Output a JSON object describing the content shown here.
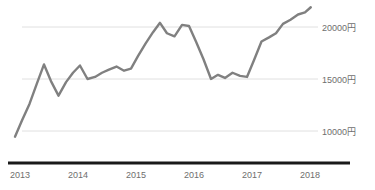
{
  "chart_data": {
    "type": "line",
    "title": "",
    "xlabel": "",
    "ylabel": "",
    "unit_suffix": "円",
    "grid": true,
    "legend": "none",
    "line_color": "#808080",
    "axis_color": "#1a1a1a",
    "gridline_color": "#e0e0e0",
    "tick_label_color": "#6e6e6e",
    "xlim": [
      2013,
      2019
    ],
    "ylim": [
      7000,
      22600
    ],
    "x_ticks": [
      "2013",
      "2014",
      "2015",
      "2016",
      "2017",
      "2018"
    ],
    "x_tick_values": [
      2013,
      2014,
      2015,
      2016,
      2017,
      2018
    ],
    "y_ticks": [
      "10000円",
      "15000円",
      "20000円"
    ],
    "y_tick_values": [
      10000,
      15000,
      20000
    ],
    "series": [
      {
        "name": "price",
        "x": [
          2013.0,
          2013.12,
          2013.25,
          2013.38,
          2013.5,
          2013.62,
          2013.75,
          2013.88,
          2014.0,
          2014.12,
          2014.25,
          2014.38,
          2014.5,
          2014.62,
          2014.75,
          2014.88,
          2015.0,
          2015.12,
          2015.25,
          2015.38,
          2015.5,
          2015.62,
          2015.75,
          2015.88,
          2016.0,
          2016.12,
          2016.25,
          2016.38,
          2016.5,
          2016.62,
          2016.75,
          2016.88,
          2017.0,
          2017.12,
          2017.25,
          2017.38,
          2017.5,
          2017.62,
          2017.75,
          2017.88,
          2018.0,
          2018.1
        ],
        "values": [
          9450,
          11000,
          12600,
          14600,
          16400,
          14800,
          13400,
          14700,
          15600,
          16300,
          15000,
          15200,
          15600,
          15900,
          16200,
          15800,
          16000,
          17200,
          18400,
          19500,
          20400,
          19400,
          19100,
          20200,
          20100,
          18600,
          16900,
          15000,
          15400,
          15100,
          15600,
          15300,
          15200,
          16800,
          18600,
          19000,
          19400,
          20300,
          20700,
          21200,
          21400,
          21900
        ]
      }
    ]
  },
  "axes": {
    "x_axis_name": "year-axis",
    "y_axis_name": "yen-axis"
  }
}
